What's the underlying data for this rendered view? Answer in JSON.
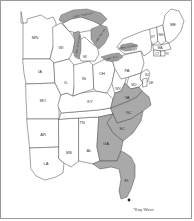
{
  "map": {
    "title": "Eastern United States choropleth map",
    "frame_border_color": "#9a9a9a",
    "background_color": "#ffffff",
    "plain_state_fill": "#ffffff",
    "highlight_state_fill": "#a9a9a9",
    "lake_fill": "#a0a0a0",
    "border_color": "#555555",
    "states": [
      {
        "code": "MN",
        "name": "Minnesota",
        "highlighted": false,
        "label_x": 34,
        "label_y": 37
      },
      {
        "code": "IA",
        "name": "Iowa",
        "highlighted": false,
        "label_x": 39,
        "label_y": 71
      },
      {
        "code": "MO",
        "name": "Missouri",
        "highlighted": false,
        "label_x": 42,
        "label_y": 100
      },
      {
        "code": "AR",
        "name": "Arkansas",
        "highlighted": false,
        "label_x": 42,
        "label_y": 134
      },
      {
        "code": "LA",
        "name": "Louisiana",
        "highlighted": false,
        "label_x": 45,
        "label_y": 163
      },
      {
        "code": "MS",
        "name": "Mississippi",
        "highlighted": false,
        "label_x": 68,
        "label_y": 152
      },
      {
        "code": "AL",
        "name": "Alabama",
        "highlighted": false,
        "label_x": 88,
        "label_y": 150
      },
      {
        "code": "TN",
        "name": "Tennessee",
        "highlighted": false,
        "label_x": 81,
        "label_y": 122
      },
      {
        "code": "KY",
        "name": "Kentucky",
        "highlighted": false,
        "label_x": 89,
        "label_y": 101
      },
      {
        "code": "WI",
        "name": "Wisconsin",
        "highlighted": false,
        "label_x": 60,
        "label_y": 47
      },
      {
        "code": "IL",
        "name": "Illinois",
        "highlighted": false,
        "label_x": 65,
        "label_y": 82
      },
      {
        "code": "IN",
        "name": "Indiana",
        "highlighted": false,
        "label_x": 83,
        "label_y": 78
      },
      {
        "code": "OH",
        "name": "Ohio",
        "highlighted": false,
        "label_x": 101,
        "label_y": 73
      },
      {
        "code": "MI",
        "name": "Michigan",
        "highlighted": false,
        "label_x": 84,
        "label_y": 56
      },
      {
        "code": "WV",
        "name": "West Virginia",
        "highlighted": false,
        "label_x": 116,
        "label_y": 88
      },
      {
        "code": "PA",
        "name": "Pennsylvania",
        "highlighted": false,
        "label_x": 126,
        "label_y": 70
      },
      {
        "code": "NY",
        "name": "New York",
        "highlighted": false,
        "label_x": 136,
        "label_y": 48
      },
      {
        "code": "VT",
        "name": "Vermont",
        "highlighted": false,
        "label_x": 152,
        "label_y": 36
      },
      {
        "code": "NH",
        "name": "New Hampshire",
        "highlighted": false,
        "label_x": 160,
        "label_y": 38
      },
      {
        "code": "ME",
        "name": "Maine",
        "highlighted": false,
        "label_x": 172,
        "label_y": 24
      },
      {
        "code": "MA",
        "name": "Massachusetts",
        "highlighted": false,
        "label_x": 159,
        "label_y": 48
      },
      {
        "code": "CT",
        "name": "Connecticut",
        "highlighted": false,
        "label_x": 157,
        "label_y": 56
      },
      {
        "code": "RI",
        "name": "Rhode Island",
        "highlighted": false,
        "label_x": 165,
        "label_y": 54
      },
      {
        "code": "NJ",
        "name": "New Jersey",
        "highlighted": false,
        "label_x": 143,
        "label_y": 74
      },
      {
        "code": "DE",
        "name": "Delaware",
        "highlighted": false,
        "label_x": 143,
        "label_y": 83
      },
      {
        "code": "MD",
        "name": "Maryland",
        "highlighted": false,
        "label_x": 135,
        "label_y": 84
      },
      {
        "code": "VA",
        "name": "Virginia",
        "highlighted": true,
        "label_x": 126,
        "label_y": 97
      },
      {
        "code": "NC",
        "name": "North Carolina",
        "highlighted": true,
        "label_x": 127,
        "label_y": 114
      },
      {
        "code": "SC",
        "name": "South Carolina",
        "highlighted": true,
        "label_x": 120,
        "label_y": 130
      },
      {
        "code": "GA",
        "name": "Georgia",
        "highlighted": true,
        "label_x": 104,
        "label_y": 145
      },
      {
        "code": "FL",
        "name": "Florida",
        "highlighted": true,
        "label_x": 125,
        "label_y": 182
      }
    ],
    "lakes": [
      {
        "code": "Lake Superior",
        "label_x": 68,
        "label_y": 15
      },
      {
        "code": "Lake Michigan",
        "label_x": 71,
        "label_y": 44
      },
      {
        "code": "Lake Huron",
        "label_x": 97,
        "label_y": 34
      },
      {
        "code": "Lake Erie",
        "label_x": 110,
        "label_y": 59
      },
      {
        "code": "Lake Ontario",
        "label_x": 126,
        "label_y": 45
      }
    ],
    "annotation": {
      "marker": "key-west-marker",
      "label": "*Key West",
      "label_x": 132,
      "label_y": 209,
      "marker_x": 128,
      "marker_y": 199
    }
  }
}
